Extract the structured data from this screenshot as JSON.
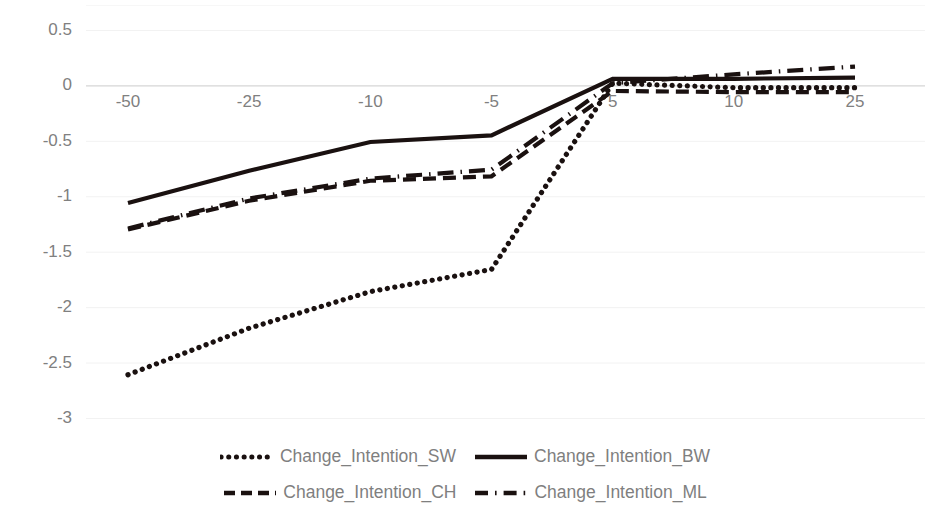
{
  "chart_data": {
    "type": "line",
    "title": "",
    "xlabel": "",
    "ylabel": "",
    "x": [
      -50,
      -25,
      -10,
      -5,
      5,
      10,
      25
    ],
    "xtick_labels": [
      "-50",
      "-25",
      "-10",
      "-5",
      "5",
      "10",
      "25"
    ],
    "ytick_labels": [
      "0.5",
      "0",
      "-0.5",
      "-1",
      "-1.5",
      "-2",
      "-2.5",
      "-3"
    ],
    "ytick_values": [
      0.5,
      0,
      -0.5,
      -1,
      -1.5,
      -2,
      -2.5,
      -3
    ],
    "ylim": [
      -3.0,
      0.5
    ],
    "grid": true,
    "grid_axis": "y",
    "grid_color": "#f2f2f2",
    "legend_position": "bottom",
    "series": [
      {
        "name": "Change_Intention_SW",
        "style": "dotted",
        "color": "#1a1110",
        "values": [
          -2.61,
          -2.19,
          -1.86,
          -1.66,
          0.02,
          -0.02,
          -0.02
        ]
      },
      {
        "name": "Change_Intention_BW",
        "style": "solid",
        "color": "#1a1110",
        "values": [
          -1.06,
          -0.77,
          -0.51,
          -0.45,
          0.06,
          0.06,
          0.07
        ]
      },
      {
        "name": "Change_Intention_CH",
        "style": "dashed",
        "color": "#1a1110",
        "values": [
          -1.3,
          -1.04,
          -0.86,
          -0.82,
          -0.05,
          -0.06,
          -0.06
        ]
      },
      {
        "name": "Change_Intention_ML",
        "style": "dash-dot",
        "color": "#1a1110",
        "values": [
          -1.29,
          -1.02,
          -0.84,
          -0.76,
          0.02,
          0.1,
          0.17
        ]
      }
    ]
  },
  "axes": {
    "y_ticks": [
      {
        "label": "0.5",
        "value": 0.5
      },
      {
        "label": "0",
        "value": 0
      },
      {
        "label": "-0.5",
        "value": -0.5
      },
      {
        "label": "-1",
        "value": -1
      },
      {
        "label": "-1.5",
        "value": -1.5
      },
      {
        "label": "-2",
        "value": -2
      },
      {
        "label": "-2.5",
        "value": -2.5
      },
      {
        "label": "-3",
        "value": -3
      }
    ],
    "x_ticks": [
      {
        "label": "-50",
        "value": -50
      },
      {
        "label": "-25",
        "value": -25
      },
      {
        "label": "-10",
        "value": -10
      },
      {
        "label": "-5",
        "value": -5
      },
      {
        "label": "5",
        "value": 5
      },
      {
        "label": "10",
        "value": 10
      },
      {
        "label": "25",
        "value": 25
      }
    ]
  },
  "legend": {
    "rows": [
      [
        {
          "name": "Change_Intention_SW",
          "style": "dotted"
        },
        {
          "name": "Change_Intention_BW",
          "style": "solid"
        }
      ],
      [
        {
          "name": "Change_Intention_CH",
          "style": "dashed"
        },
        {
          "name": "Change_Intention_ML",
          "style": "dash-dot"
        }
      ]
    ]
  },
  "style": {
    "line_color": "#1a1110",
    "label_color": "#808080",
    "legend_text_color": "#7f7f7f",
    "grid_color": "#f2f2f2",
    "zero_line_color": "#d9d9d9",
    "background": "#ffffff"
  }
}
